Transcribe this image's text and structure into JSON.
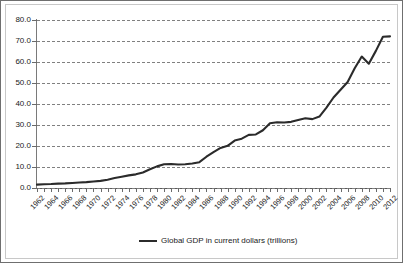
{
  "chart_data": {
    "type": "line",
    "title": "",
    "xlabel": "",
    "ylabel": "",
    "ylim": [
      0,
      80
    ],
    "ytick_step": 10,
    "ytick_labels": [
      "0.0",
      "10.0",
      "20.0",
      "30.0",
      "40.0",
      "50.0",
      "60.0",
      "70.0",
      "80.0"
    ],
    "ytick_values": [
      0,
      10,
      20,
      30,
      40,
      50,
      60,
      70,
      80
    ],
    "grid": true,
    "grid_style": "dashed",
    "grid_color": "#808080",
    "legend_position": "bottom-center",
    "legend": [
      "Global GDP in current dollars (trillions)"
    ],
    "line_color": "#2b2b2b",
    "xlim": [
      1962,
      2012
    ],
    "xtick_label_interval": 2,
    "x": [
      1962,
      1963,
      1964,
      1965,
      1966,
      1967,
      1968,
      1969,
      1970,
      1971,
      1972,
      1973,
      1974,
      1975,
      1976,
      1977,
      1978,
      1979,
      1980,
      1981,
      1982,
      1983,
      1984,
      1985,
      1986,
      1987,
      1988,
      1989,
      1990,
      1991,
      1992,
      1993,
      1994,
      1995,
      1996,
      1997,
      1998,
      1999,
      2000,
      2001,
      2002,
      2003,
      2004,
      2005,
      2006,
      2007,
      2008,
      2009,
      2010,
      2011,
      2012
    ],
    "xtick_labels": [
      "1962",
      "1964",
      "1966",
      "1968",
      "1970",
      "1972",
      "1974",
      "1976",
      "1978",
      "1980",
      "1982",
      "1984",
      "1986",
      "1988",
      "1990",
      "1992",
      "1994",
      "1996",
      "1998",
      "2000",
      "2002",
      "2004",
      "2006",
      "2008",
      "2010",
      "2012"
    ],
    "series": [
      {
        "name": "Global GDP in current dollars (trillions)",
        "values": [
          1.6,
          1.8,
          1.9,
          2.1,
          2.2,
          2.4,
          2.6,
          2.8,
          3.1,
          3.4,
          3.9,
          4.8,
          5.4,
          6.0,
          6.5,
          7.4,
          8.9,
          10.3,
          11.3,
          11.4,
          11.2,
          11.3,
          11.7,
          12.3,
          14.9,
          17.1,
          19.1,
          20.1,
          22.6,
          23.5,
          25.3,
          25.5,
          27.5,
          30.8,
          31.3,
          31.2,
          31.5,
          32.4,
          33.2,
          32.8,
          34.0,
          38.3,
          43.1,
          46.8,
          50.5,
          57.0,
          62.6,
          59.2,
          65.3,
          72.0,
          72.2
        ]
      }
    ]
  },
  "legend": {
    "label": "Global GDP in current dollars (trillions)"
  }
}
